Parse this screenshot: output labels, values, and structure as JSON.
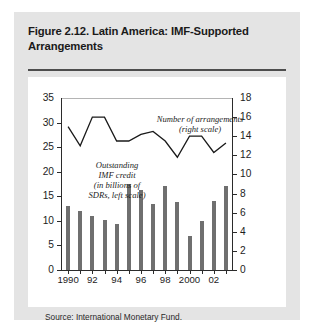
{
  "figure": {
    "title": "Figure 2.12. Latin America: IMF-Supported Arrangements",
    "source": "Source: International Monetary Fund."
  },
  "chart_data": {
    "type": "bar",
    "title": "Figure 2.12. Latin America: IMF-Supported Arrangements",
    "xlabel": "",
    "ylabel": "",
    "grid": false,
    "legend_position": "inline-annotations",
    "categories": [
      "1990",
      "1991",
      "1992",
      "1993",
      "1994",
      "1995",
      "1996",
      "1997",
      "1998",
      "1999",
      "2000",
      "2001",
      "2002",
      "2003"
    ],
    "xtick_labels": [
      "1990",
      "",
      "92",
      "",
      "94",
      "",
      "96",
      "",
      "98",
      "",
      "2000",
      "",
      "02",
      ""
    ],
    "left_axis": {
      "label": "Outstanding IMF credit (in billions of SDRs, left scale)",
      "ylim": [
        0,
        35
      ],
      "ticks": [
        0,
        5,
        10,
        15,
        20,
        25,
        30,
        35
      ]
    },
    "right_axis": {
      "label": "Number of arrangements (right scale)",
      "ylim": [
        0,
        18
      ],
      "ticks": [
        0,
        2,
        4,
        6,
        8,
        10,
        12,
        14,
        16,
        18
      ]
    },
    "series": [
      {
        "name": "Outstanding IMF credit (in billions of SDRs, left scale)",
        "type": "bar",
        "axis": "left",
        "color": "#6f6f6f",
        "values": [
          13.0,
          12.0,
          11.0,
          10.2,
          9.3,
          17.5,
          16.2,
          13.5,
          17.0,
          13.8,
          7.0,
          10.0,
          14.0,
          17.0
        ]
      },
      {
        "name": "Number of arrangements (right scale)",
        "type": "line",
        "axis": "right",
        "color": "#1a1a1a",
        "values": [
          15.0,
          13.0,
          16.0,
          16.0,
          13.5,
          13.5,
          14.2,
          14.5,
          13.5,
          11.8,
          14.0,
          14.0,
          12.3,
          13.3
        ]
      }
    ],
    "annotations": [
      {
        "text": "Outstanding\nIMF credit\n(in billions of\nSDRs, left scale)",
        "target": "bars"
      },
      {
        "text": "Number of arrangements\n(right scale)",
        "target": "line"
      }
    ]
  },
  "colors": {
    "card_background": "#e4e4e4",
    "plot_background": "#ffffff",
    "bar": "#6f6f6f",
    "line": "#1a1a1a",
    "axis": "#2b2b2b",
    "gridline": "#b4b4b4",
    "rule": "#4d4d4d",
    "text": "#1a1a1a"
  }
}
